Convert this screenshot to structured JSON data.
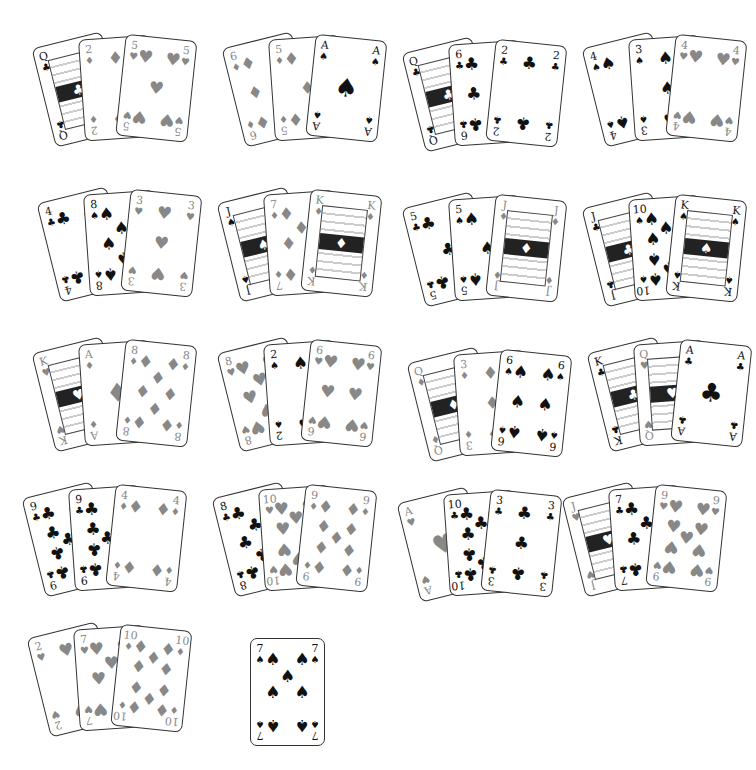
{
  "hands": [
    {
      "cards": [
        {
          "rank": "Q",
          "suit": "clubs"
        },
        {
          "rank": "2",
          "suit": "diamonds"
        },
        {
          "rank": "5",
          "suit": "hearts"
        }
      ]
    },
    {
      "cards": [
        {
          "rank": "6",
          "suit": "diamonds"
        },
        {
          "rank": "5",
          "suit": "diamonds"
        },
        {
          "rank": "A",
          "suit": "spades"
        }
      ]
    },
    {
      "cards": [
        {
          "rank": "Q",
          "suit": "clubs"
        },
        {
          "rank": "6",
          "suit": "clubs"
        },
        {
          "rank": "2",
          "suit": "clubs"
        }
      ]
    },
    {
      "cards": [
        {
          "rank": "4",
          "suit": "spades"
        },
        {
          "rank": "3",
          "suit": "spades"
        },
        {
          "rank": "4",
          "suit": "hearts"
        }
      ]
    },
    {
      "cards": [
        {
          "rank": "4",
          "suit": "clubs"
        },
        {
          "rank": "8",
          "suit": "spades"
        },
        {
          "rank": "3",
          "suit": "hearts"
        }
      ]
    },
    {
      "cards": [
        {
          "rank": "J",
          "suit": "spades"
        },
        {
          "rank": "7",
          "suit": "diamonds"
        },
        {
          "rank": "K",
          "suit": "diamonds"
        }
      ]
    },
    {
      "cards": [
        {
          "rank": "5",
          "suit": "clubs"
        },
        {
          "rank": "5",
          "suit": "spades"
        },
        {
          "rank": "J",
          "suit": "diamonds"
        }
      ]
    },
    {
      "cards": [
        {
          "rank": "J",
          "suit": "clubs"
        },
        {
          "rank": "10",
          "suit": "spades"
        },
        {
          "rank": "K",
          "suit": "spades"
        }
      ]
    },
    {
      "cards": [
        {
          "rank": "K",
          "suit": "hearts"
        },
        {
          "rank": "A",
          "suit": "diamonds"
        },
        {
          "rank": "8",
          "suit": "diamonds"
        }
      ]
    },
    {
      "cards": [
        {
          "rank": "8",
          "suit": "hearts"
        },
        {
          "rank": "2",
          "suit": "spades"
        },
        {
          "rank": "6",
          "suit": "hearts"
        }
      ]
    },
    {
      "cards": [
        {
          "rank": "Q",
          "suit": "diamonds"
        },
        {
          "rank": "3",
          "suit": "diamonds"
        },
        {
          "rank": "6",
          "suit": "spades"
        }
      ]
    },
    {
      "cards": [
        {
          "rank": "K",
          "suit": "clubs"
        },
        {
          "rank": "Q",
          "suit": "hearts"
        },
        {
          "rank": "A",
          "suit": "clubs"
        }
      ]
    },
    {
      "cards": [
        {
          "rank": "9",
          "suit": "clubs"
        },
        {
          "rank": "9",
          "suit": "clubs"
        },
        {
          "rank": "4",
          "suit": "diamonds"
        }
      ]
    },
    {
      "cards": [
        {
          "rank": "8",
          "suit": "clubs"
        },
        {
          "rank": "10",
          "suit": "hearts"
        },
        {
          "rank": "9",
          "suit": "diamonds"
        }
      ]
    },
    {
      "cards": [
        {
          "rank": "A",
          "suit": "hearts"
        },
        {
          "rank": "10",
          "suit": "clubs"
        },
        {
          "rank": "3",
          "suit": "clubs"
        }
      ]
    },
    {
      "cards": [
        {
          "rank": "J",
          "suit": "hearts"
        },
        {
          "rank": "7",
          "suit": "clubs"
        },
        {
          "rank": "9",
          "suit": "hearts"
        }
      ]
    },
    {
      "cards": [
        {
          "rank": "2",
          "suit": "hearts"
        },
        {
          "rank": "7",
          "suit": "hearts"
        },
        {
          "rank": "10",
          "suit": "diamonds"
        }
      ]
    },
    {
      "cards": [
        {
          "rank": "7",
          "suit": "spades"
        }
      ]
    }
  ],
  "suit_glyphs": {
    "spades": "♠",
    "hearts": "♥",
    "diamonds": "♦",
    "clubs": "♣"
  },
  "colors": {
    "red_suit": "#888888",
    "black_suit": "#111111",
    "card_border": "#333333",
    "background": "#ffffff"
  }
}
